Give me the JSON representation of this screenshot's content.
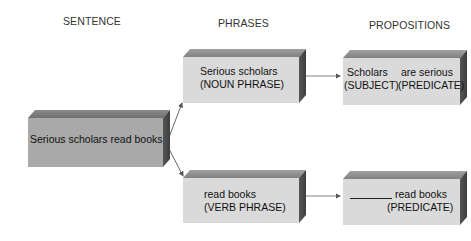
{
  "columns": {
    "sentence": "SENTENCE",
    "phrases": "PHRASES",
    "propositions": "PROPOSITIONS"
  },
  "sentence_box": {
    "text": "Serious scholars read books"
  },
  "phrases": [
    {
      "line1": "Serious scholars",
      "line2": "(NOUN PHRASE)"
    },
    {
      "line1": "read books",
      "line2": "(VERB PHRASE)"
    }
  ],
  "propositions": [
    {
      "subject": "Scholars",
      "subject_label": "(SUBJECT)",
      "predicate": "are serious",
      "predicate_label": "(PREDICATE)"
    },
    {
      "subject_blank": "__________",
      "predicate": "read books",
      "predicate_label": "(PREDICATE)"
    }
  ],
  "colors": {
    "box_front_light": "#dadada",
    "box_front_dark": "#a9a9a9",
    "box_side": "#4a4a4a",
    "arrow": "#555555"
  }
}
